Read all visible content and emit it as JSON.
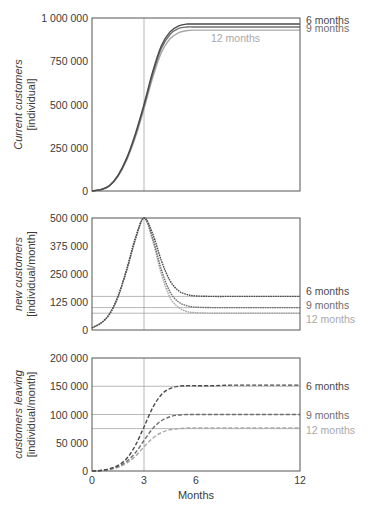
{
  "colors": {
    "6 months": "#4a4a4a",
    "9 months": "#6e6e6e",
    "12 months": "#a8a8a8",
    "axis": "#555555",
    "grid": "#9a9a9a"
  },
  "chart_data": [
    {
      "type": "line",
      "title": "",
      "ylabel": "Current customers [individual]",
      "ylabel_lines": [
        "Current customers",
        "[individual]"
      ],
      "ylabel_italic_part": "Current customers",
      "xlabel": "",
      "xlim": [
        0,
        12
      ],
      "ylim": [
        0,
        1000000
      ],
      "yticks": [
        0,
        250000,
        500000,
        750000,
        1000000
      ],
      "ytick_labels": [
        "0",
        "250 000",
        "500 000",
        "750 000",
        "1 000 000"
      ],
      "xticks": [],
      "vline_x": 3,
      "hlines": [],
      "line_style": "solid",
      "legend_position": "right, at line ends",
      "x": [
        0,
        0.5,
        1,
        1.5,
        2,
        2.5,
        3,
        3.5,
        4,
        4.5,
        5,
        5.5,
        6,
        7,
        8,
        9,
        10,
        11,
        12
      ],
      "series": [
        {
          "name": "6 months",
          "values": [
            0,
            8000,
            30000,
            90000,
            190000,
            330000,
            500000,
            690000,
            840000,
            920000,
            955000,
            965000,
            965000,
            965000,
            965000,
            965000,
            965000,
            965000,
            965000
          ]
        },
        {
          "name": "9 months",
          "values": [
            0,
            8000,
            30000,
            88000,
            185000,
            320000,
            490000,
            675000,
            825000,
            905000,
            940000,
            948000,
            948000,
            948000,
            948000,
            948000,
            948000,
            948000,
            948000
          ]
        },
        {
          "name": "12 months",
          "values": [
            0,
            7000,
            28000,
            84000,
            178000,
            310000,
            475000,
            655000,
            800000,
            880000,
            915000,
            928000,
            930000,
            930000,
            930000,
            930000,
            930000,
            930000,
            930000
          ]
        }
      ],
      "legend_labels": [
        {
          "text": "6 months",
          "series": "6 months",
          "y_value": 990000
        },
        {
          "text": "9 months",
          "series": "9 months",
          "y_value": 940000
        },
        {
          "text": "12 months",
          "series": "12 months",
          "y_value": 885000,
          "inside": true
        }
      ]
    },
    {
      "type": "line",
      "title": "",
      "ylabel": "new customers [individual/month]",
      "ylabel_lines": [
        "new customers",
        "[individual/month]"
      ],
      "xlabel": "",
      "xlim": [
        0,
        12
      ],
      "ylim": [
        0,
        500000
      ],
      "yticks": [
        0,
        125000,
        250000,
        375000,
        500000
      ],
      "ytick_labels": [
        "0",
        "125 000",
        "250 000",
        "375 000",
        "500 000"
      ],
      "xticks": [],
      "vline_x": 3,
      "hlines": [
        150000,
        100000,
        75000
      ],
      "line_style": "dotted",
      "legend_position": "right",
      "x": [
        0,
        0.5,
        1,
        1.5,
        2,
        2.5,
        3,
        3.5,
        4,
        4.5,
        5,
        5.5,
        6,
        7,
        8,
        9,
        10,
        11,
        12
      ],
      "series": [
        {
          "name": "6 months",
          "values": [
            10000,
            30000,
            70000,
            150000,
            270000,
            410000,
            500000,
            430000,
            310000,
            220000,
            175000,
            158000,
            152000,
            150000,
            150000,
            150000,
            150000,
            150000,
            150000
          ]
        },
        {
          "name": "9 months",
          "values": [
            10000,
            30000,
            70000,
            150000,
            268000,
            405000,
            500000,
            410000,
            270000,
            170000,
            125000,
            108000,
            102000,
            100000,
            100000,
            100000,
            100000,
            100000,
            100000
          ]
        },
        {
          "name": "12 months",
          "values": [
            10000,
            30000,
            70000,
            148000,
            265000,
            400000,
            500000,
            400000,
            250000,
            145000,
            100000,
            82000,
            77000,
            75000,
            75000,
            75000,
            75000,
            75000,
            75000
          ]
        }
      ],
      "legend_labels": [
        {
          "text": "6 months",
          "series": "6 months",
          "y_value": 172000
        },
        {
          "text": "9 months",
          "series": "9 months",
          "y_value": 110000
        },
        {
          "text": "12 months",
          "series": "12 months",
          "y_value": 48000
        }
      ]
    },
    {
      "type": "line",
      "title": "",
      "ylabel": "customers leaving [individual/month]",
      "ylabel_lines": [
        "customers leaving",
        "[individual/month]"
      ],
      "xlabel": "Months",
      "xlim": [
        0,
        12
      ],
      "ylim": [
        0,
        200000
      ],
      "yticks": [
        0,
        50000,
        100000,
        150000,
        200000
      ],
      "ytick_labels": [
        "0",
        "50 000",
        "100 000",
        "150 000",
        "200 000"
      ],
      "xticks": [
        0,
        3,
        6,
        12
      ],
      "xtick_labels": [
        "0",
        "3",
        "6",
        "12"
      ],
      "vline_x": 3,
      "hlines": [
        150000,
        100000,
        75000
      ],
      "line_style": "dashed",
      "legend_position": "right",
      "x": [
        0,
        0.5,
        1,
        1.5,
        2,
        2.5,
        3,
        3.5,
        4,
        4.5,
        5,
        5.5,
        6,
        7,
        8,
        9,
        10,
        11,
        12
      ],
      "series": [
        {
          "name": "6 months",
          "values": [
            0,
            1000,
            4000,
            10000,
            22000,
            45000,
            78000,
            112000,
            135000,
            146000,
            150000,
            151000,
            151000,
            151000,
            152000,
            152000,
            152000,
            152000,
            152000
          ]
        },
        {
          "name": "9 months",
          "values": [
            0,
            800,
            3000,
            8000,
            17000,
            32000,
            54000,
            75000,
            89000,
            96000,
            99000,
            100000,
            100000,
            100000,
            100000,
            100000,
            100000,
            100000,
            100000
          ]
        },
        {
          "name": "12 months",
          "values": [
            0,
            700,
            2500,
            6500,
            14000,
            26000,
            43000,
            58000,
            68000,
            73000,
            75000,
            76000,
            76000,
            76000,
            76000,
            76000,
            76000,
            76000,
            76000
          ]
        }
      ],
      "legend_labels": [
        {
          "text": "6 months",
          "series": "6 months",
          "y_value": 150000
        },
        {
          "text": "9 months",
          "series": "9 months",
          "y_value": 100000
        },
        {
          "text": "12 months",
          "series": "12 months",
          "y_value": 72000
        }
      ]
    }
  ],
  "layout": [
    {
      "left": 92,
      "right": 300,
      "top": 18,
      "bottom": 191
    },
    {
      "left": 92,
      "right": 300,
      "top": 218,
      "bottom": 330
    },
    {
      "left": 92,
      "right": 300,
      "top": 358,
      "bottom": 471
    }
  ]
}
